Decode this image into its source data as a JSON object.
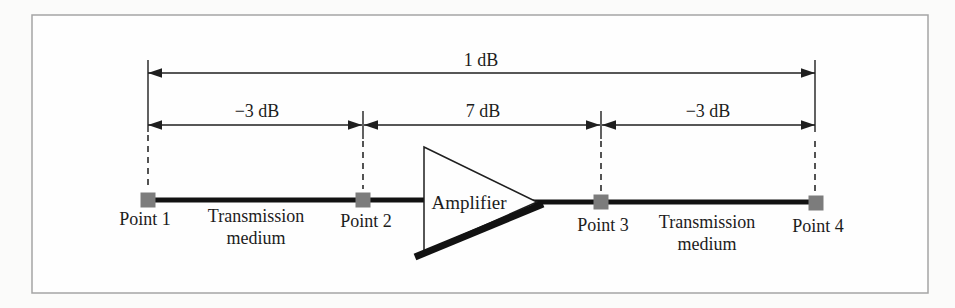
{
  "figure": {
    "type": "signal-gain-diagram",
    "colors": {
      "background": "#fbfbfa",
      "frame_fill": "#fefefe",
      "frame_border": "#a5a5a5",
      "line": "#1f1f1f",
      "point_marker": "#7c7c7c"
    },
    "gains": {
      "total": "1 dB",
      "segment1": "−3 dB",
      "segment2": "7 dB",
      "segment3": "−3 dB"
    },
    "points": {
      "p1": "Point 1",
      "p2": "Point 2",
      "p3": "Point 3",
      "p4": "Point 4"
    },
    "media": {
      "left_line1": "Transmission",
      "left_line2": "medium",
      "right_line1": "Transmission",
      "right_line2": "medium"
    },
    "amplifier_label": "Amplifier"
  }
}
